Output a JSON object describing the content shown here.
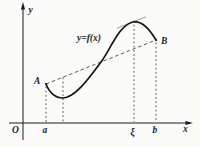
{
  "figure": {
    "type": "function-graph",
    "caption_semantics": "Graph of y=f(x) on [a,b] with chord AB and a parallel tangent at x=ξ (mean value theorem illustration)",
    "axis": {
      "x_label": "x",
      "y_label": "y",
      "origin_label": "O"
    },
    "curve": {
      "label": "y=f(x)"
    },
    "points": {
      "A_label": "A",
      "B_label": "B"
    },
    "x_ticks": {
      "a_label": "a",
      "xi_label": "ξ",
      "b_label": "b"
    },
    "colors": {
      "background": "#fbfbf9",
      "axis_line": "#1c1c1c",
      "curve_line": "#151515",
      "dashed_line": "#3c3c3c",
      "tangent_line": "#8f8f8f"
    }
  }
}
